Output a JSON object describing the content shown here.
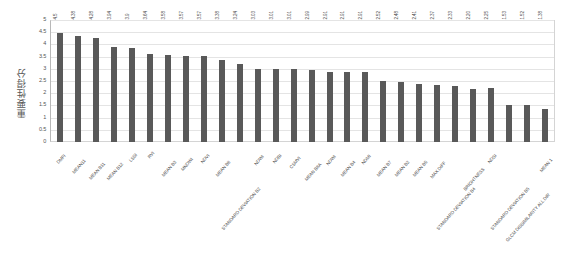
{
  "chart_data": {
    "type": "bar",
    "title": "",
    "subtitle": "",
    "xlabel": "",
    "ylabel": "重要性得分",
    "ylim": [
      0,
      5
    ],
    "ytick_labels": [
      "5",
      "4.5",
      "4",
      "3.5",
      "3",
      "2.5",
      "2",
      "1.5",
      "1",
      "0.5",
      "0"
    ],
    "ytick_values": [
      5,
      4.5,
      4,
      3.5,
      3,
      2.5,
      2,
      1.5,
      1,
      0.5,
      0
    ],
    "grid": true,
    "legend": false,
    "legend_position": "none",
    "bar_color": "#595959",
    "plot_bg": "#ffffff",
    "grid_color": "#e4e4e4",
    "frame_color": "#d4d4d4",
    "categories": [
      "DMFI",
      "MEAN11",
      "MEAN B11",
      "MEAN B12",
      "LSSI",
      "RVI",
      "MEAN B3",
      "MNDWI",
      "NDVI",
      "MEAN B8",
      "STANDARD DEVIATION B2",
      "NDWI",
      "NDBI",
      "CSMVI",
      "MEAN B8A",
      "NDWI",
      "MEAN B4",
      "NDMI",
      "MEAN B7",
      "MEAN B2",
      "MEAN B5",
      "MAX DIFF",
      "STANDARD DEVIATION B4",
      "BRIGHTNESS",
      "NDSI",
      "STANDARD DEVIATION B5",
      "GLCM DISSIMILARITY ALL DIR",
      "MEAN 1"
    ],
    "values": [
      4.5,
      4.38,
      4.28,
      3.94,
      3.9,
      3.64,
      3.58,
      3.57,
      3.57,
      3.38,
      3.24,
      3.03,
      3.01,
      3.01,
      2.99,
      2.91,
      2.91,
      2.91,
      2.52,
      2.48,
      2.41,
      2.37,
      2.33,
      2.2,
      2.25,
      1.53,
      1.52,
      1.38
    ],
    "value_labels": [
      "4.5",
      "4.38",
      "4.28",
      "3.94",
      "3.9",
      "3.64",
      "3.58",
      "3.57",
      "3.57",
      "3.38",
      "3.24",
      "3.03",
      "3.01",
      "3.01",
      "2.99",
      "2.91",
      "2.91",
      "2.91",
      "2.52",
      "2.48",
      "2.41",
      "2.37",
      "2.33",
      "2.20",
      "2.25",
      "1.53",
      "1.52",
      "1.38"
    ]
  }
}
